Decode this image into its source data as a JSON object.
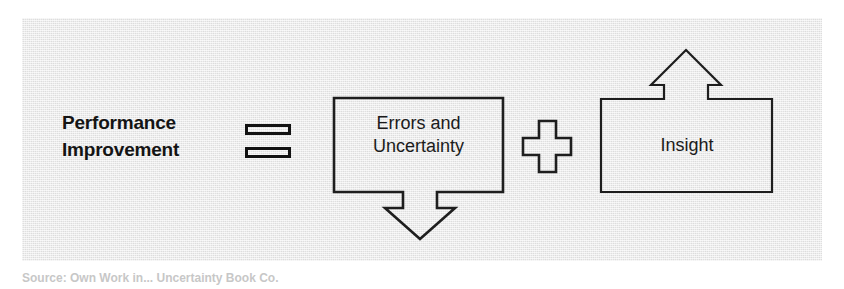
{
  "figure": {
    "type": "equation-diagram",
    "background_color": "#e9e9e9",
    "stroke_color": "#1e1e1e",
    "equation_terms": {
      "left_side": {
        "line1": "Performance",
        "line2": "Improvement"
      },
      "operator_equals": "=",
      "term_1": {
        "line1": "Errors and",
        "line2": "Uncertainty",
        "arrow_direction": "down"
      },
      "operator_plus": "+",
      "term_2": {
        "line1": "Insight",
        "arrow_direction": "up"
      }
    }
  },
  "caption": {
    "text": "Source: Own Work in... Uncertainty Book Co."
  }
}
